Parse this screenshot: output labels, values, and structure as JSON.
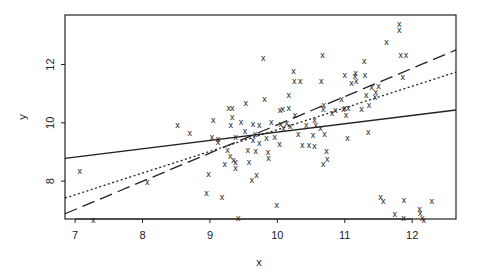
{
  "chart_data": {
    "type": "scatter",
    "title": "",
    "xlabel": "x",
    "ylabel": "y",
    "xlim": [
      6.85,
      12.65
    ],
    "ylim": [
      6.7,
      13.7
    ],
    "xticks": [
      7,
      8,
      9,
      10,
      11,
      12
    ],
    "yticks": [
      8,
      10,
      12
    ],
    "grid": false,
    "marker": "x",
    "points": [
      [
        7.07,
        8.36
      ],
      [
        7.27,
        6.67
      ],
      [
        8.07,
        7.96
      ],
      [
        8.52,
        9.93
      ],
      [
        8.7,
        9.64
      ],
      [
        8.98,
        8.25
      ],
      [
        8.95,
        7.6
      ],
      [
        9.03,
        9.53
      ],
      [
        9.05,
        10.09
      ],
      [
        9.12,
        9.46
      ],
      [
        9.12,
        9.35
      ],
      [
        9.18,
        7.46
      ],
      [
        9.22,
        8.6
      ],
      [
        9.28,
        10.52
      ],
      [
        9.33,
        10.52
      ],
      [
        9.33,
        10.2
      ],
      [
        9.26,
        9.06
      ],
      [
        9.31,
        9.93
      ],
      [
        9.3,
        8.85
      ],
      [
        9.35,
        8.74
      ],
      [
        9.38,
        9.5
      ],
      [
        9.38,
        8.64
      ],
      [
        9.38,
        8.45
      ],
      [
        9.42,
        6.75
      ],
      [
        9.46,
        10.02
      ],
      [
        9.52,
        9.71
      ],
      [
        9.53,
        10.67
      ],
      [
        9.56,
        9.06
      ],
      [
        9.58,
        8.64
      ],
      [
        9.62,
        8.03
      ],
      [
        9.64,
        9.97
      ],
      [
        9.64,
        9.42
      ],
      [
        9.67,
        9.6
      ],
      [
        9.68,
        9.05
      ],
      [
        9.69,
        8.21
      ],
      [
        9.73,
        9.93
      ],
      [
        9.73,
        9.31
      ],
      [
        9.81,
        10.81
      ],
      [
        9.84,
        9.49
      ],
      [
        9.79,
        12.22
      ],
      [
        9.86,
        9.0
      ],
      [
        9.87,
        8.81
      ],
      [
        9.91,
        10.04
      ],
      [
        9.96,
        9.53
      ],
      [
        9.99,
        7.18
      ],
      [
        10.03,
        9.28
      ],
      [
        10.04,
        10.44
      ],
      [
        10.05,
        9.96
      ],
      [
        10.08,
        10.48
      ],
      [
        10.09,
        9.82
      ],
      [
        10.14,
        10.0
      ],
      [
        10.17,
        10.96
      ],
      [
        10.17,
        10.52
      ],
      [
        10.19,
        9.89
      ],
      [
        10.24,
        11.78
      ],
      [
        10.25,
        11.42
      ],
      [
        10.26,
        10.28
      ],
      [
        10.31,
        9.6
      ],
      [
        10.34,
        11.42
      ],
      [
        10.37,
        9.25
      ],
      [
        10.43,
        9.93
      ],
      [
        10.47,
        9.23
      ],
      [
        10.53,
        9.57
      ],
      [
        10.55,
        10.08
      ],
      [
        10.55,
        9.21
      ],
      [
        10.57,
        9.93
      ],
      [
        10.64,
        9.82
      ],
      [
        10.65,
        11.42
      ],
      [
        10.67,
        12.33
      ],
      [
        10.68,
        10.48
      ],
      [
        10.69,
        10.6
      ],
      [
        10.7,
        9.6
      ],
      [
        10.73,
        9.03
      ],
      [
        10.74,
        8.76
      ],
      [
        10.68,
        8.6
      ],
      [
        10.81,
        10.33
      ],
      [
        10.86,
        10.44
      ],
      [
        10.95,
        10.82
      ],
      [
        10.98,
        10.48
      ],
      [
        11.0,
        10.52
      ],
      [
        11.0,
        11.64
      ],
      [
        11.02,
        10.28
      ],
      [
        11.05,
        10.51
      ],
      [
        11.04,
        9.47
      ],
      [
        11.1,
        11.35
      ],
      [
        11.15,
        11.6
      ],
      [
        11.16,
        11.71
      ],
      [
        11.17,
        11.42
      ],
      [
        11.25,
        10.48
      ],
      [
        11.29,
        12.11
      ],
      [
        11.3,
        11.63
      ],
      [
        11.32,
        10.96
      ],
      [
        11.35,
        9.68
      ],
      [
        11.36,
        10.6
      ],
      [
        11.4,
        11.24
      ],
      [
        11.45,
        10.89
      ],
      [
        11.46,
        11.06
      ],
      [
        11.5,
        11.28
      ],
      [
        11.62,
        12.76
      ],
      [
        11.81,
        13.39
      ],
      [
        11.81,
        13.18
      ],
      [
        11.83,
        12.33
      ],
      [
        11.91,
        12.33
      ],
      [
        11.86,
        11.57
      ],
      [
        11.53,
        7.47
      ],
      [
        11.57,
        7.32
      ],
      [
        11.74,
        6.86
      ],
      [
        11.88,
        7.36
      ],
      [
        11.87,
        6.72
      ],
      [
        12.11,
        7.04
      ],
      [
        12.12,
        6.9
      ],
      [
        12.15,
        6.72
      ],
      [
        12.17,
        6.65
      ],
      [
        12.29,
        7.32
      ]
    ],
    "lines": [
      {
        "name": "fit-solid",
        "style": "solid",
        "x": [
          6.85,
          12.65
        ],
        "y": [
          8.78,
          10.44
        ]
      },
      {
        "name": "fit-dotted",
        "style": "dotted",
        "x": [
          6.85,
          12.65
        ],
        "y": [
          7.42,
          11.74
        ]
      },
      {
        "name": "fit-dashed",
        "style": "dashed",
        "x": [
          6.85,
          12.65
        ],
        "y": [
          6.88,
          12.5
        ]
      }
    ]
  },
  "colors": {
    "axis": "#222222",
    "marker": "#222222",
    "background": "#ffffff"
  }
}
